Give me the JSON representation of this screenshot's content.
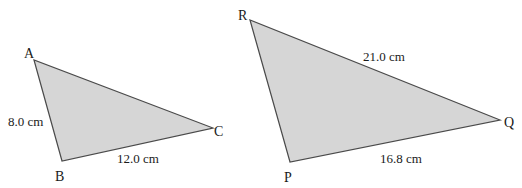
{
  "figure": {
    "triangle_abc": {
      "vertices": {
        "A": {
          "label": "A",
          "x": 34,
          "y": 60
        },
        "B": {
          "label": "B",
          "x": 62,
          "y": 161
        },
        "C": {
          "label": "C",
          "x": 213,
          "y": 128
        }
      },
      "sides": {
        "AB": {
          "label": "8.0 cm"
        },
        "BC": {
          "label": "12.0 cm"
        }
      },
      "fill": "#d6d6d6",
      "stroke": "#4a4a4a"
    },
    "triangle_pqr": {
      "vertices": {
        "R": {
          "label": "R",
          "x": 250,
          "y": 20
        },
        "P": {
          "label": "P",
          "x": 290,
          "y": 162
        },
        "Q": {
          "label": "Q",
          "x": 500,
          "y": 120
        }
      },
      "sides": {
        "RQ": {
          "label": "21.0 cm"
        },
        "PQ": {
          "label": "16.8 cm"
        }
      },
      "fill": "#d6d6d6",
      "stroke": "#4a4a4a"
    }
  }
}
